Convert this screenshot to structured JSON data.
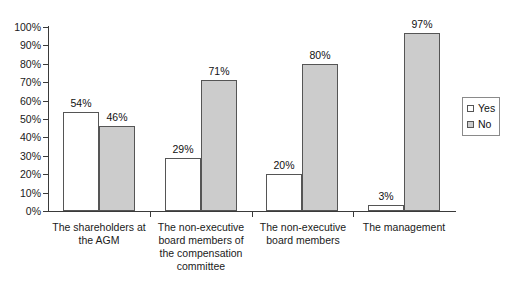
{
  "chart_data": {
    "type": "bar",
    "title": "",
    "subtitle": "",
    "xlabel": "",
    "ylabel": "",
    "ylim": [
      0,
      100
    ],
    "grid": false,
    "legend_position": "right",
    "categories": [
      "The shareholders at the AGM",
      "The non-executive board members of the compensation committee",
      "The non-executive board members",
      "The management"
    ],
    "category_lines": [
      [
        "The shareholders at",
        "the AGM"
      ],
      [
        "The non-executive",
        "board members of",
        "the compensation",
        "committee"
      ],
      [
        "The non-executive",
        "board members"
      ],
      [
        "The management"
      ]
    ],
    "series": [
      {
        "name": "Yes",
        "color": "#ffffff",
        "values": [
          54,
          46,
          29,
          71
        ],
        "values_by_category": [
          54,
          29,
          20,
          3
        ],
        "value_labels": [
          "54%",
          "29%",
          "20%",
          "3%"
        ]
      },
      {
        "name": "No",
        "color": "#cccccc",
        "values_by_category": [
          46,
          71,
          80,
          97
        ],
        "value_labels": [
          "46%",
          "71%",
          "80%",
          "97%"
        ]
      }
    ],
    "y_ticks": [
      0,
      10,
      20,
      30,
      40,
      50,
      60,
      70,
      80,
      90,
      100
    ],
    "y_tick_labels": [
      "0%",
      "10%",
      "20%",
      "30%",
      "40%",
      "50%",
      "60%",
      "70%",
      "80%",
      "90%",
      "100%"
    ]
  },
  "legend": {
    "items": [
      {
        "label": "Yes",
        "swatch": "series-yes"
      },
      {
        "label": "No",
        "swatch": "series-no"
      }
    ]
  },
  "axis_colors": {
    "axis": "#3a3a3a",
    "bar_outline": "#555555",
    "no_fill": "#cccccc",
    "yes_fill": "#ffffff",
    "text": "#111111"
  }
}
